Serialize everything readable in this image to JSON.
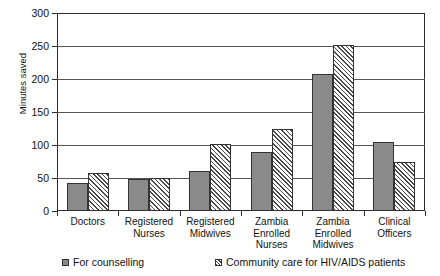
{
  "chart_data": {
    "type": "bar",
    "title": "",
    "xlabel": "",
    "ylabel": "Minutes saved",
    "ylim": [
      0,
      300
    ],
    "yticks": [
      0,
      50,
      100,
      150,
      200,
      250,
      300
    ],
    "ytick_labels": [
      "0",
      "50",
      "100",
      "150",
      "200",
      "250",
      "300"
    ],
    "grid": true,
    "legend_position": "bottom",
    "categories": [
      "Doctors",
      "Registered Nurses",
      "Registered Midwives",
      "Zambia Enrolled Nurses",
      "Zambia Enrolled Midwives",
      "Clinical Officers"
    ],
    "category_lines": [
      [
        "Doctors"
      ],
      [
        "Registered",
        "Nurses"
      ],
      [
        "Registered",
        "Midwives"
      ],
      [
        "Zambia",
        "Enrolled",
        "Nurses"
      ],
      [
        "Zambia",
        "Enrolled",
        "Midwives"
      ],
      [
        "Clinical",
        "Officers"
      ]
    ],
    "series": [
      {
        "name": "For counselling",
        "pattern": "solid",
        "color": "#8a8a8a",
        "values": [
          42,
          48,
          61,
          89,
          207,
          104
        ]
      },
      {
        "name": "Community care for HIV/AIDS patients",
        "pattern": "hatch",
        "color": "#ffffff",
        "values": [
          57,
          50,
          102,
          124,
          252,
          74
        ]
      }
    ]
  },
  "legend": {
    "items": [
      {
        "label": "For counselling",
        "pattern": "solid"
      },
      {
        "label": "Community care for HIV/AIDS patients",
        "pattern": "hatch"
      }
    ]
  }
}
